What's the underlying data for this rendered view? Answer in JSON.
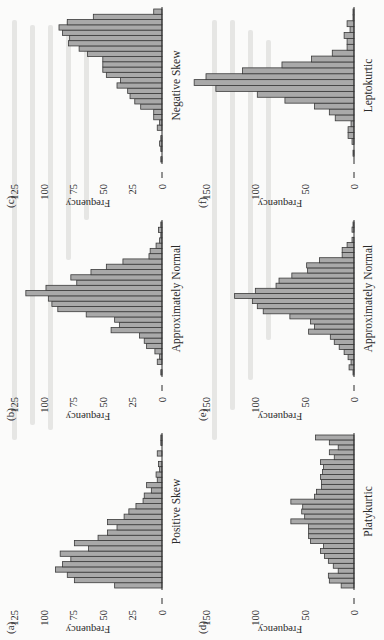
{
  "chart_data": [
    {
      "id": "a",
      "panel_label": "(a)",
      "type": "bar",
      "title": "",
      "xlabel": "Positive Skew",
      "ylabel": "Frequency",
      "ylim": [
        0,
        125
      ],
      "yticks": [
        0,
        25,
        50,
        75,
        100,
        125
      ],
      "grid": false,
      "values": [
        40,
        74,
        80,
        90,
        84,
        77,
        86,
        62,
        74,
        54,
        46,
        38,
        46,
        32,
        28,
        22,
        16,
        15,
        9,
        13,
        4,
        5,
        2,
        3,
        0,
        4,
        0,
        1,
        1
      ]
    },
    {
      "id": "b",
      "panel_label": "(b)",
      "type": "bar",
      "title": "",
      "xlabel": "Approximately Normal",
      "ylabel": "Frequency",
      "ylim": [
        0,
        125
      ],
      "yticks": [
        0,
        25,
        50,
        75,
        100,
        125
      ],
      "grid": false,
      "values": [
        1,
        0,
        4,
        2,
        6,
        13,
        15,
        19,
        43,
        36,
        40,
        64,
        88,
        93,
        96,
        115,
        98,
        72,
        77,
        60,
        47,
        33,
        11,
        10,
        5,
        2,
        1,
        3,
        1
      ]
    },
    {
      "id": "c",
      "panel_label": "(c)",
      "type": "bar",
      "title": "",
      "xlabel": "Negative Skew",
      "ylabel": "Frequency",
      "ylim": [
        0,
        125
      ],
      "yticks": [
        0,
        25,
        50,
        75,
        100,
        125
      ],
      "grid": false,
      "values": [
        1,
        0,
        1,
        2,
        1,
        0,
        4,
        2,
        7,
        7,
        18,
        23,
        27,
        29,
        38,
        35,
        47,
        50,
        50,
        50,
        63,
        70,
        79,
        78,
        84,
        87,
        80,
        58,
        7
      ]
    },
    {
      "id": "d",
      "panel_label": "(d)",
      "type": "bar",
      "title": "",
      "xlabel": "Platykurtic",
      "ylabel": "Frequency",
      "ylim": [
        0,
        150
      ],
      "yticks": [
        0,
        50,
        100,
        150
      ],
      "grid": false,
      "values": [
        13,
        25,
        26,
        16,
        21,
        26,
        30,
        34,
        31,
        44,
        46,
        46,
        46,
        64,
        50,
        53,
        52,
        64,
        40,
        38,
        33,
        33,
        34,
        32,
        31,
        34,
        20,
        25,
        16,
        25,
        39
      ]
    },
    {
      "id": "e",
      "panel_label": "(e)",
      "type": "bar",
      "title": "",
      "xlabel": "Approximately Normal",
      "ylabel": "Frequency",
      "ylim": [
        0,
        150
      ],
      "yticks": [
        0,
        50,
        100,
        150
      ],
      "grid": false,
      "values": [
        1,
        5,
        3,
        6,
        10,
        15,
        20,
        24,
        46,
        40,
        44,
        65,
        92,
        98,
        103,
        121,
        100,
        79,
        76,
        63,
        47,
        48,
        35,
        12,
        12,
        7,
        2,
        0,
        2,
        1
      ]
    },
    {
      "id": "f",
      "panel_label": "(f)",
      "type": "bar",
      "title": "",
      "xlabel": "Leptokurtic",
      "ylabel": "Frequency",
      "ylim": [
        0,
        150
      ],
      "yticks": [
        0,
        50,
        100,
        150
      ],
      "grid": false,
      "values": [
        0,
        1,
        0,
        2,
        6,
        6,
        3,
        19,
        25,
        40,
        70,
        98,
        140,
        162,
        150,
        113,
        73,
        43,
        22,
        7,
        7,
        10,
        4,
        7,
        1,
        1
      ]
    }
  ],
  "style": {
    "bar_fill": "#a9a9a9",
    "bar_stroke": "#3a3a3a",
    "axis_color": "#2a2a2a",
    "page_bg": "#fbfbfa"
  },
  "layout": {
    "orientation": "rotated -90deg (page scanned sideways)",
    "grid": [
      [
        "a",
        "b",
        "c"
      ],
      [
        "d",
        "e",
        "f"
      ]
    ]
  }
}
